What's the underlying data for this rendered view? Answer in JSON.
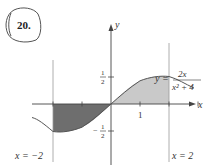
{
  "problem": {
    "number": "20."
  },
  "figure": {
    "function_label_lhs": "y =",
    "function_numerator": "2x",
    "function_denominator": "x² + 4",
    "axis_x_label": "x",
    "axis_y_label": "y",
    "tick_x_1": "1",
    "tick_y_half_num": "1",
    "tick_y_half_den": "2",
    "tick_y_neg_half_sign": "−",
    "tick_y_neg_half_num": "1",
    "tick_y_neg_half_den": "2",
    "bound_left_label": "x = −2",
    "bound_right_label": "x = 2",
    "colors": {
      "negative_region": "#6e6e6e",
      "positive_region": "#c9c9c9",
      "curve": "#555555",
      "axes": "#444444",
      "bounds": "#9a9a9a"
    }
  }
}
